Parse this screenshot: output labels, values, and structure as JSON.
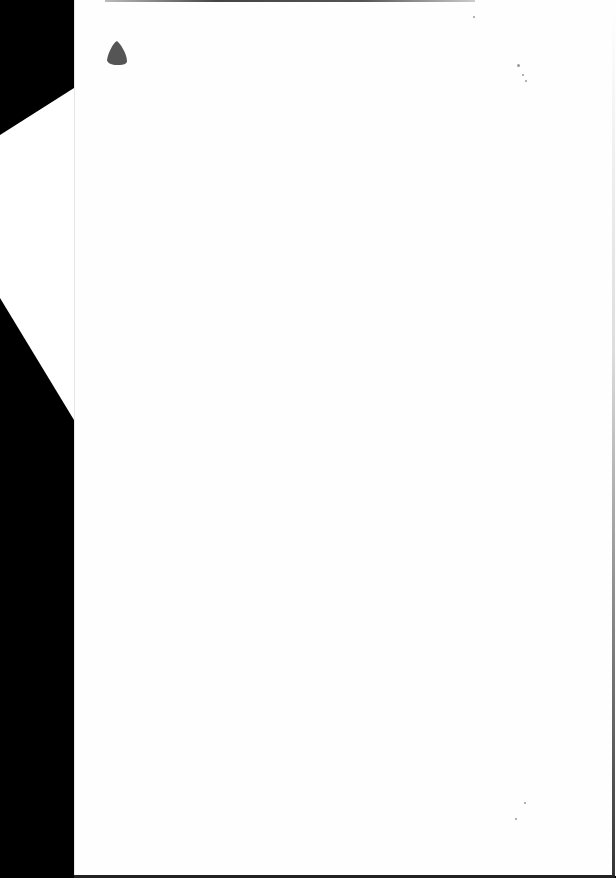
{
  "document": {
    "type": "scanned-page",
    "content": "",
    "background_color": "#000000",
    "page_color": "#fefefe",
    "marks": [
      {
        "name": "ink-blot",
        "color": "#555555"
      },
      {
        "name": "dust-specks",
        "color": "#999999"
      }
    ]
  }
}
